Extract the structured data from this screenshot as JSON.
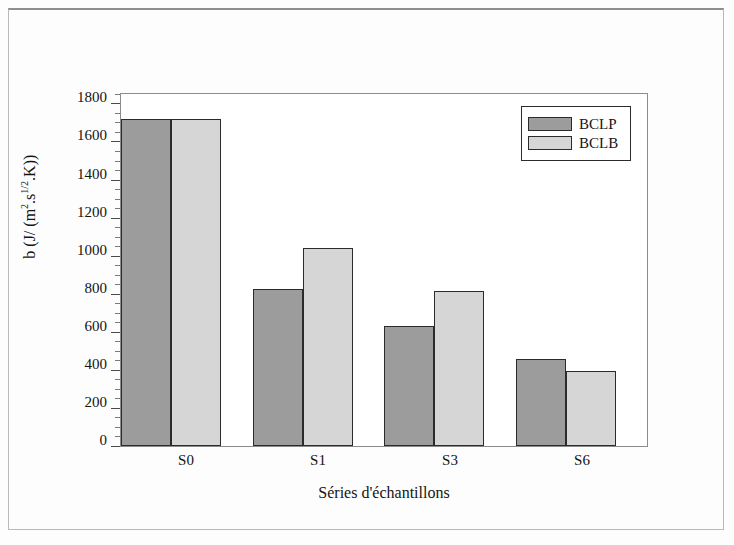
{
  "chart_data": {
    "type": "bar",
    "title": "",
    "xlabel": "Séries d'échantillons",
    "ylabel": "b (J/ (m2.s1/2.K))",
    "ylabel_parts": {
      "prefix": "b (J/ (m",
      "sup1": "2",
      "mid": ".s",
      "sup2": "1/2",
      "suffix": ".K))"
    },
    "categories": [
      "S0",
      "S1",
      "S3",
      "S6"
    ],
    "series": [
      {
        "name": "BCLP",
        "color": "#9c9c9c",
        "values": [
          1720,
          825,
          630,
          455
        ]
      },
      {
        "name": "BCLB",
        "color": "#d6d6d6",
        "values": [
          1720,
          1040,
          815,
          395
        ]
      }
    ],
    "ylim": [
      0,
      1860
    ],
    "ytick_labels": [
      "0",
      "200",
      "400",
      "600",
      "800",
      "1000",
      "1200",
      "1400",
      "1600",
      "1800"
    ],
    "ytick_values": [
      0,
      200,
      400,
      600,
      800,
      1000,
      1200,
      1400,
      1600,
      1800
    ],
    "minor_tick_step": 50,
    "grid": false,
    "legend_position": "top-right",
    "legend_entries": [
      "BCLP",
      "BCLB"
    ]
  }
}
